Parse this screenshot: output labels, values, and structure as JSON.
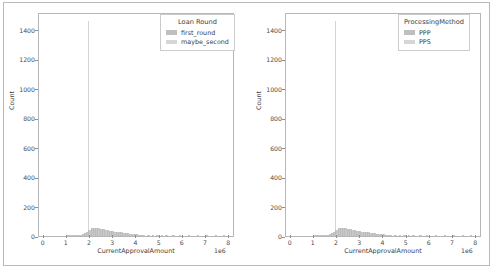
{
  "figure": {
    "panels": [
      {
        "name": "left-panel",
        "legend": {
          "title": "Loan Round",
          "entries": [
            {
              "label": "first_round",
              "color": "#bfbfbf"
            },
            {
              "label": "maybe_second",
              "color": "#d6d6d6"
            }
          ]
        },
        "chart_data": {
          "type": "bar",
          "title": "",
          "xlabel": "CurrentApprovalAmount",
          "ylabel": "Count",
          "x_exponent": "1e6",
          "xlim": [
            -200000,
            8400000
          ],
          "ylim": [
            0,
            1520
          ],
          "grid": false,
          "legend_position": "upper right",
          "xticks": [
            0,
            1,
            2,
            3,
            4,
            5,
            6,
            7,
            8
          ],
          "xticklabels": [
            "0",
            "1",
            "2",
            "3",
            "4",
            "5",
            "6",
            "7",
            "8"
          ],
          "yticks": [
            0,
            200,
            400,
            600,
            800,
            1000,
            1200,
            1400
          ],
          "yticklabels": [
            "0",
            "200",
            "400",
            "600",
            "800",
            "1000",
            "1200",
            "1400"
          ],
          "series": [
            {
              "name": "first_round",
              "color": "#c8c8c8",
              "bin_centers": [
                1050000,
                1150000,
                1250000,
                1350000,
                1450000,
                1550000,
                1650000,
                1750000,
                1850000,
                1950000,
                2000000,
                2050000,
                2150000,
                2250000,
                2350000,
                2450000,
                2550000,
                2650000,
                2750000,
                2850000,
                2950000,
                3050000,
                3150000,
                3250000,
                3350000,
                3450000,
                3550000,
                3650000,
                3750000,
                3850000,
                3950000,
                4050000,
                4150000,
                4250000,
                4350000,
                4450000,
                4650000,
                4850000,
                5050000,
                5250000,
                5450000,
                5750000,
                6050000,
                6450000,
                6850000,
                7250000,
                7650000,
                8000000
              ],
              "values": [
                2,
                3,
                4,
                5,
                6,
                8,
                10,
                14,
                20,
                26,
                1470,
                44,
                52,
                56,
                58,
                54,
                50,
                46,
                42,
                38,
                34,
                32,
                30,
                28,
                26,
                25,
                23,
                21,
                19,
                17,
                15,
                13,
                11,
                10,
                9,
                8,
                7,
                6,
                5,
                5,
                4,
                4,
                3,
                3,
                2,
                2,
                2,
                2
              ]
            }
          ],
          "annotations": [
            {
              "text": "tall spike at x = 2e6 reaching ~1470",
              "x": 2000000,
              "y": 1470
            }
          ]
        }
      },
      {
        "name": "right-panel",
        "legend": {
          "title": "ProcessingMethod",
          "entries": [
            {
              "label": "PPP",
              "color": "#bfbfbf"
            },
            {
              "label": "PPS",
              "color": "#d6d6d6"
            }
          ]
        },
        "chart_data": {
          "type": "bar",
          "title": "",
          "xlabel": "CurrentApprovalAmount",
          "ylabel": "Count",
          "x_exponent": "1e6",
          "xlim": [
            -200000,
            8400000
          ],
          "ylim": [
            0,
            1520
          ],
          "grid": false,
          "legend_position": "upper right",
          "xticks": [
            0,
            1,
            2,
            3,
            4,
            5,
            6,
            7,
            8
          ],
          "xticklabels": [
            "0",
            "1",
            "2",
            "3",
            "4",
            "5",
            "6",
            "7",
            "8"
          ],
          "yticks": [
            0,
            200,
            400,
            600,
            800,
            1000,
            1200,
            1400
          ],
          "yticklabels": [
            "0",
            "200",
            "400",
            "600",
            "800",
            "1000",
            "1200",
            "1400"
          ],
          "series": [
            {
              "name": "PPP",
              "color": "#c8c8c8",
              "bin_centers": [
                1050000,
                1150000,
                1250000,
                1350000,
                1450000,
                1550000,
                1650000,
                1750000,
                1850000,
                1950000,
                2000000,
                2050000,
                2150000,
                2250000,
                2350000,
                2450000,
                2550000,
                2650000,
                2750000,
                2850000,
                2950000,
                3050000,
                3150000,
                3250000,
                3350000,
                3450000,
                3550000,
                3650000,
                3750000,
                3850000,
                3950000,
                4050000,
                4150000,
                4250000,
                4350000,
                4450000,
                4650000,
                4850000,
                5050000,
                5250000,
                5450000,
                5750000,
                6050000,
                6450000,
                6850000,
                7250000,
                7650000,
                8000000
              ],
              "values": [
                2,
                3,
                4,
                5,
                6,
                8,
                10,
                14,
                20,
                26,
                1470,
                44,
                52,
                56,
                58,
                54,
                50,
                46,
                42,
                38,
                34,
                32,
                30,
                28,
                26,
                25,
                23,
                21,
                19,
                17,
                15,
                13,
                11,
                10,
                9,
                8,
                7,
                6,
                5,
                5,
                4,
                4,
                3,
                3,
                2,
                2,
                2,
                2
              ]
            }
          ],
          "annotations": [
            {
              "text": "tall spike at x = 2e6 reaching ~1470",
              "x": 2000000,
              "y": 1470
            }
          ]
        }
      }
    ]
  }
}
